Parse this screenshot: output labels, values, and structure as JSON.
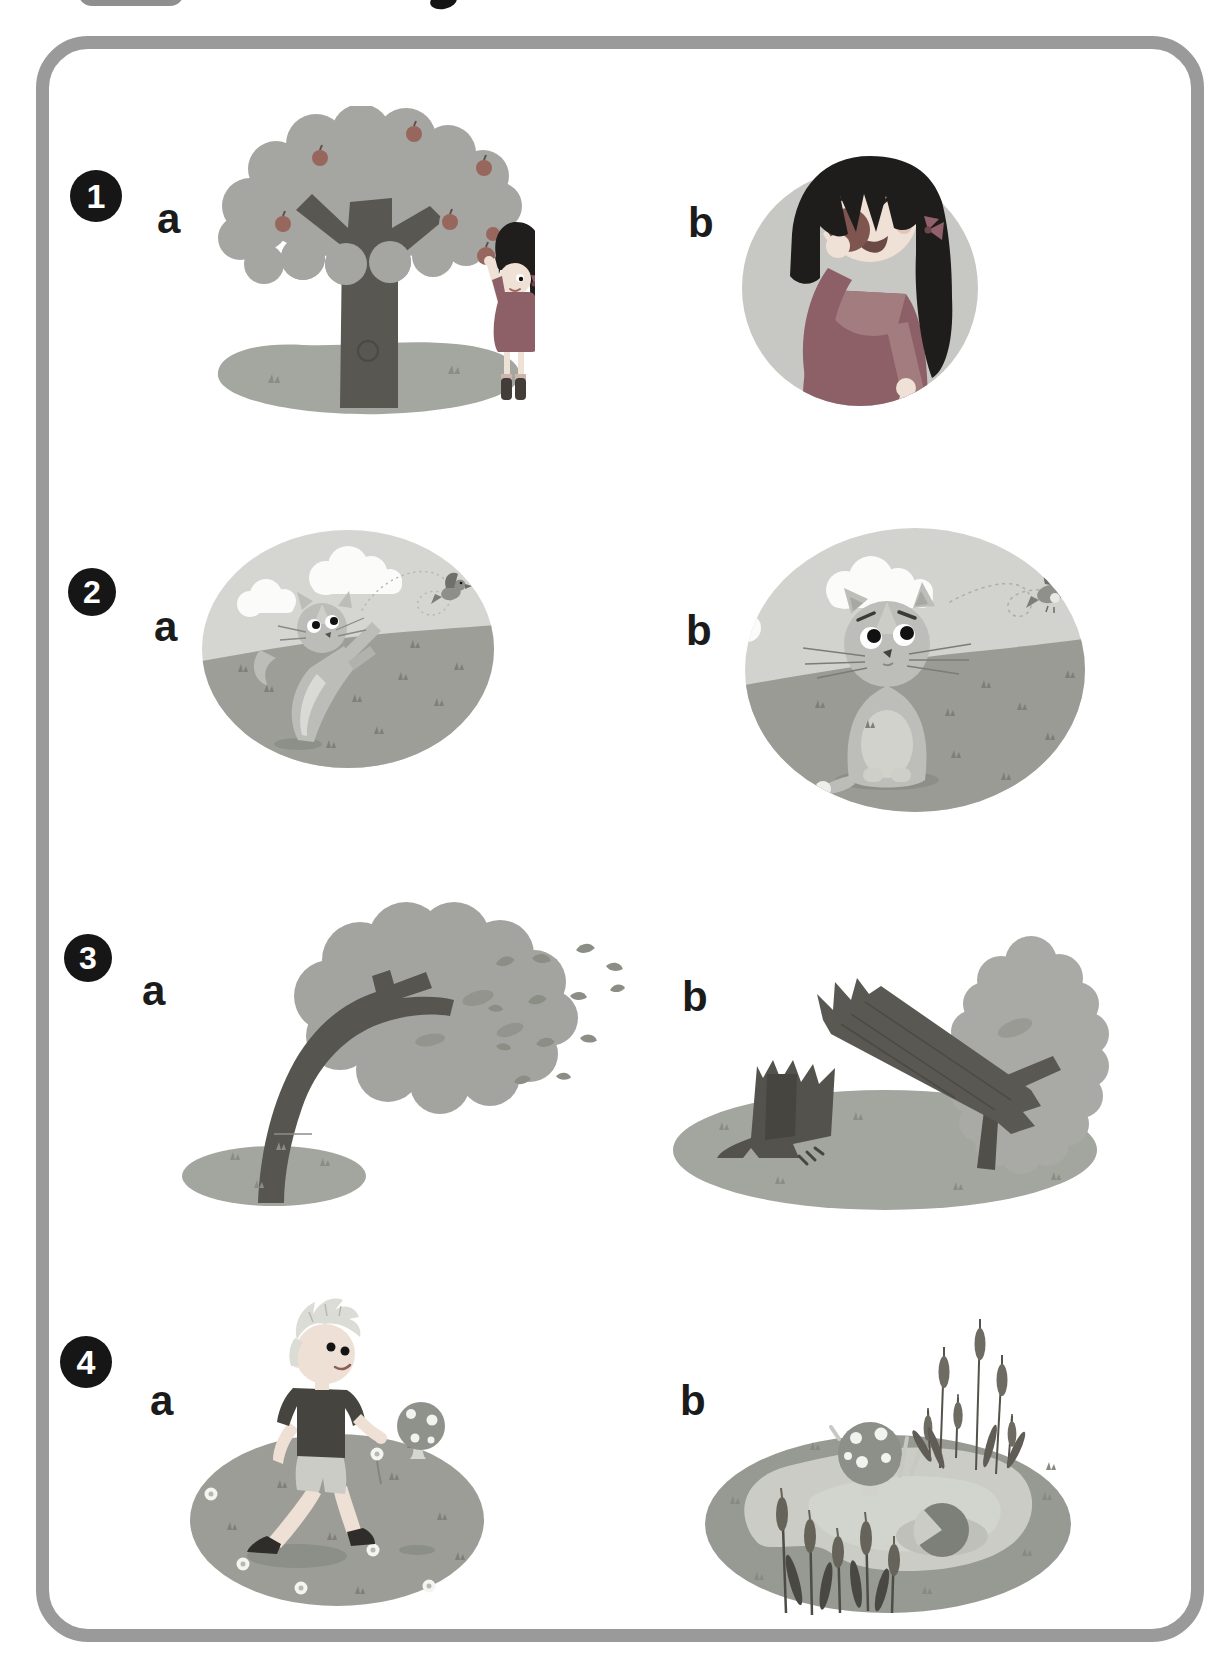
{
  "page": {
    "kind": "children-workbook-listening-exercise",
    "visible_title_text": ""
  },
  "colors": {
    "frame": "#9a9a9a",
    "badge-bg": "#161616",
    "badge-fg": "#ffffff",
    "label": "#1b1b1b",
    "page-bg": "#ffffff"
  },
  "exercises": [
    {
      "number": "1",
      "options": [
        {
          "label": "a",
          "scene": "girl-picking-apple-from-tree"
        },
        {
          "label": "b",
          "scene": "girl-eating-apple"
        }
      ]
    },
    {
      "number": "2",
      "options": [
        {
          "label": "a",
          "scene": "cat-leaping-at-flying-bird"
        },
        {
          "label": "b",
          "scene": "cat-sitting-sad-bird-flying-away"
        }
      ]
    },
    {
      "number": "3",
      "options": [
        {
          "label": "a",
          "scene": "tree-bending-in-wind-leaves-blowing"
        },
        {
          "label": "b",
          "scene": "broken-tree-stump-and-fallen-trunk-by-bush"
        }
      ]
    },
    {
      "number": "4",
      "options": [
        {
          "label": "a",
          "scene": "boy-walking-in-meadow-past-mushroom"
        },
        {
          "label": "b",
          "scene": "pond-with-bulrushes-mushroom-and-lily-pad"
        }
      ]
    }
  ]
}
